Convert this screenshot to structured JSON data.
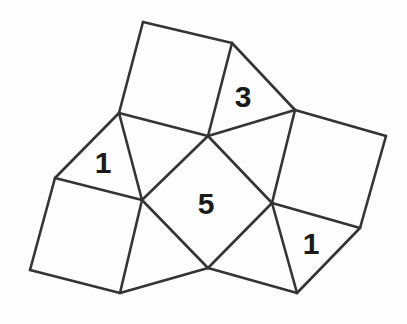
{
  "figure": {
    "background_color": "#fdfdfd",
    "stroke_color": "#343434",
    "stroke_width": 2.6,
    "label_color": "#1a1a1a",
    "canvas": {
      "width": 407,
      "height": 324
    },
    "vertices": {
      "top_apex": {
        "x": 143,
        "y": 22
      },
      "top_right": {
        "x": 232,
        "y": 43
      },
      "upper_left_hub": {
        "x": 119,
        "y": 113
      },
      "center_hub": {
        "x": 208,
        "y": 136
      },
      "right_hub": {
        "x": 295,
        "y": 110
      },
      "far_right": {
        "x": 386,
        "y": 136
      },
      "left_corner": {
        "x": 55,
        "y": 178
      },
      "left_hub": {
        "x": 142,
        "y": 200
      },
      "right_lower_hub": {
        "x": 272,
        "y": 203
      },
      "right_lower": {
        "x": 360,
        "y": 228
      },
      "bottom_left": {
        "x": 30,
        "y": 270
      },
      "bottom_mid_left": {
        "x": 120,
        "y": 293
      },
      "bottom_hub": {
        "x": 208,
        "y": 268
      },
      "bottom_right": {
        "x": 297,
        "y": 293
      }
    },
    "shapes": [
      {
        "name": "top-square",
        "kind": "square",
        "label": null,
        "points": "143,22 232,43 208,136 119,113"
      },
      {
        "name": "right-square",
        "kind": "square",
        "label": null,
        "points": "295,110 386,136 360,228 272,203"
      },
      {
        "name": "bottom-left-square",
        "kind": "square",
        "label": null,
        "points": "55,178 142,200 120,293 30,270"
      },
      {
        "name": "center-square",
        "kind": "square",
        "label": "5",
        "label_x": 206,
        "label_y": 203,
        "points": "208,136 272,203 208,268 142,200"
      },
      {
        "name": "triangle-three",
        "kind": "triangle",
        "label": "3",
        "label_x": 243,
        "label_y": 96,
        "points": "232,43 295,110 208,136"
      },
      {
        "name": "triangle-left-one",
        "kind": "triangle",
        "label": "1",
        "label_x": 103,
        "label_y": 162,
        "points": "119,113 142,200 55,178"
      },
      {
        "name": "triangle-right-one",
        "kind": "triangle",
        "label": "1",
        "label_x": 311,
        "label_y": 243,
        "points": "272,203 360,228 297,293"
      },
      {
        "name": "triangle-upper-left-fill",
        "kind": "triangle",
        "label": null,
        "points": "119,113 208,136 142,200"
      },
      {
        "name": "triangle-upper-right-fill",
        "kind": "triangle",
        "label": null,
        "points": "208,136 295,110 272,203"
      },
      {
        "name": "triangle-bottom-left-fill",
        "kind": "triangle",
        "label": null,
        "points": "142,200 208,268 120,293"
      },
      {
        "name": "triangle-bottom-right-fill",
        "kind": "triangle",
        "label": null,
        "points": "208,268 272,203 297,293"
      }
    ],
    "edges": [
      {
        "name": "edge-top-apex-to-top-right",
        "x1": 143,
        "y1": 22,
        "x2": 232,
        "y2": 43
      },
      {
        "name": "edge-top-apex-to-upper-left-hub",
        "x1": 143,
        "y1": 22,
        "x2": 119,
        "y2": 113
      },
      {
        "name": "edge-top-right-to-center-hub",
        "x1": 232,
        "y1": 43,
        "x2": 208,
        "y2": 136
      },
      {
        "name": "edge-top-right-to-right-hub",
        "x1": 232,
        "y1": 43,
        "x2": 295,
        "y2": 110
      },
      {
        "name": "edge-upper-left-hub-to-center-hub",
        "x1": 119,
        "y1": 113,
        "x2": 208,
        "y2": 136
      },
      {
        "name": "edge-center-hub-to-right-hub",
        "x1": 208,
        "y1": 136,
        "x2": 295,
        "y2": 110
      },
      {
        "name": "edge-right-hub-to-far-right",
        "x1": 295,
        "y1": 110,
        "x2": 386,
        "y2": 136
      },
      {
        "name": "edge-far-right-to-right-lower",
        "x1": 386,
        "y1": 136,
        "x2": 360,
        "y2": 228
      },
      {
        "name": "edge-right-hub-to-right-lower-hub",
        "x1": 295,
        "y1": 110,
        "x2": 272,
        "y2": 203
      },
      {
        "name": "edge-right-lower-hub-to-lower",
        "x1": 272,
        "y1": 203,
        "x2": 360,
        "y2": 228
      },
      {
        "name": "edge-right-lower-to-bottom-right",
        "x1": 360,
        "y1": 228,
        "x2": 297,
        "y2": 293
      },
      {
        "name": "edge-right-lower-hub-to-bot-right",
        "x1": 272,
        "y1": 203,
        "x2": 297,
        "y2": 293
      },
      {
        "name": "edge-upper-left-hub-to-left-corner",
        "x1": 119,
        "y1": 113,
        "x2": 55,
        "y2": 178
      },
      {
        "name": "edge-upper-left-hub-to-left-hub",
        "x1": 119,
        "y1": 113,
        "x2": 142,
        "y2": 200
      },
      {
        "name": "edge-left-corner-to-left-hub",
        "x1": 55,
        "y1": 178,
        "x2": 142,
        "y2": 200
      },
      {
        "name": "edge-left-corner-to-bottom-left",
        "x1": 55,
        "y1": 178,
        "x2": 30,
        "y2": 270
      },
      {
        "name": "edge-bottom-left-to-bot-mid-left",
        "x1": 30,
        "y1": 270,
        "x2": 120,
        "y2": 293
      },
      {
        "name": "edge-left-hub-to-bot-mid-left",
        "x1": 142,
        "y1": 200,
        "x2": 120,
        "y2": 293
      },
      {
        "name": "edge-center-hub-to-left-hub",
        "x1": 208,
        "y1": 136,
        "x2": 142,
        "y2": 200
      },
      {
        "name": "edge-center-hub-to-right-lwr-hub",
        "x1": 208,
        "y1": 136,
        "x2": 272,
        "y2": 203
      },
      {
        "name": "edge-left-hub-to-bottom-hub",
        "x1": 142,
        "y1": 200,
        "x2": 208,
        "y2": 268
      },
      {
        "name": "edge-right-lwr-hub-to-bottom-hub",
        "x1": 272,
        "y1": 203,
        "x2": 208,
        "y2": 268
      },
      {
        "name": "edge-bottom-hub-to-bot-mid-left",
        "x1": 208,
        "y1": 268,
        "x2": 120,
        "y2": 293
      },
      {
        "name": "edge-bottom-hub-to-bottom-right",
        "x1": 208,
        "y1": 268,
        "x2": 297,
        "y2": 293
      }
    ],
    "labels": [
      {
        "name": "label-three",
        "text": "3",
        "x": 243,
        "y": 96,
        "size": 31
      },
      {
        "name": "label-five",
        "text": "5",
        "x": 206,
        "y": 203,
        "size": 32
      },
      {
        "name": "label-left-one",
        "text": "1",
        "x": 103,
        "y": 162,
        "size": 31
      },
      {
        "name": "label-right-one",
        "text": "1",
        "x": 311,
        "y": 243,
        "size": 31
      }
    ]
  }
}
